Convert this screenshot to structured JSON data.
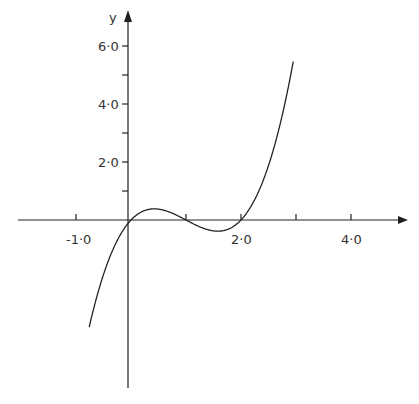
{
  "chart_data": {
    "type": "line",
    "title": "",
    "xlabel": "",
    "ylabel": "y",
    "function": "y = x(x-1)(x-2)",
    "xlim": [
      -2.0,
      5.0
    ],
    "ylim": [
      -6.0,
      6.5
    ],
    "x_tick_labels": [
      "-1·0",
      "2·0",
      "4·0"
    ],
    "x_ticks": [
      -1,
      1,
      2,
      3,
      4
    ],
    "y_tick_labels": [
      "2·0",
      "4·0",
      "6·0"
    ],
    "y_ticks": [
      1,
      2,
      3,
      4,
      5,
      6
    ],
    "grid": false,
    "series": [
      {
        "name": "curve",
        "x": [
          -0.75,
          -0.5,
          -0.25,
          0,
          0.25,
          0.42,
          0.75,
          1.0,
          1.25,
          1.58,
          1.75,
          2.0,
          2.25,
          2.5,
          2.75,
          2.95
        ],
        "y": [
          -4.92,
          -1.88,
          -0.7,
          0,
          0.33,
          0.38,
          0.23,
          0,
          -0.23,
          -0.38,
          -0.33,
          0,
          0.7,
          1.88,
          3.61,
          5.46
        ]
      }
    ],
    "roots": [
      0,
      1,
      2
    ]
  }
}
